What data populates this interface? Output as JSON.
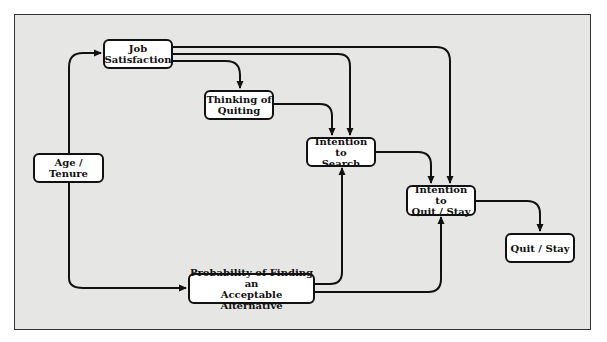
{
  "diagram": {
    "title": "",
    "nodes": {
      "job_satisfaction": "Job\nSatisfaction",
      "thinking_of_quiting": "Thinking of\nQuiting",
      "age_tenure": "Age / Tenure",
      "intention_to_search": "Intention to\nSearch",
      "intention_to_quit_stay": "Intention to\nQuit / Stay",
      "quit_stay": "Quit / Stay",
      "probability_alternative": "Probability of Finding an\nAcceptable Alternative"
    },
    "edges": [
      {
        "from": "Age / Tenure",
        "to": "Job Satisfaction"
      },
      {
        "from": "Age / Tenure",
        "to": "Probability of Finding an Acceptable Alternative"
      },
      {
        "from": "Job Satisfaction",
        "to": "Thinking of Quiting"
      },
      {
        "from": "Job Satisfaction",
        "to": "Intention to Search"
      },
      {
        "from": "Job Satisfaction",
        "to": "Intention to Quit / Stay"
      },
      {
        "from": "Thinking of Quiting",
        "to": "Intention to Search"
      },
      {
        "from": "Intention to Search",
        "to": "Intention to Quit / Stay"
      },
      {
        "from": "Probability of Finding an Acceptable Alternative",
        "to": "Intention to Search"
      },
      {
        "from": "Probability of Finding an Acceptable Alternative",
        "to": "Intention to Quit / Stay"
      },
      {
        "from": "Intention to Quit / Stay",
        "to": "Quit / Stay"
      }
    ],
    "colors": {
      "background": "#e6e6e4",
      "box_fill": "#ffffff",
      "stroke": "#111111"
    }
  }
}
